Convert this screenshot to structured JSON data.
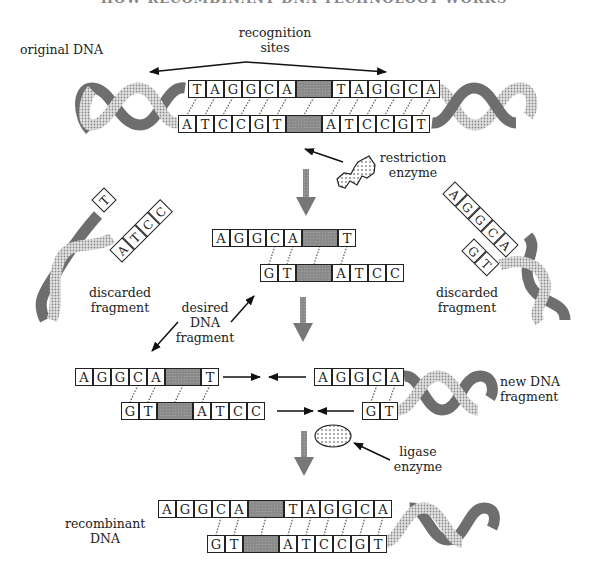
{
  "title": "HOW RECOMBINANT DNA TECHNOLOGY WORKS",
  "colors": {
    "box_border": "#222222",
    "box_fill": "#ffffff",
    "cut_site_fill": "#8a8a8a",
    "helix_dark": "#6e6e6e",
    "helix_light": "#b8b8b8",
    "arrow": "#111111",
    "process_arrow": "#7a7a7a"
  },
  "labels": {
    "recognition_sites": [
      "recognition",
      "sites"
    ],
    "original_dna": "original DNA",
    "restriction_enzyme": [
      "restriction",
      "enzyme"
    ],
    "discarded_fragment_left": [
      "discarded",
      "fragment"
    ],
    "discarded_fragment_right": [
      "discarded",
      "fragment"
    ],
    "desired_dna_fragment": [
      "desired",
      "DNA",
      "fragment"
    ],
    "new_dna_fragment": [
      "new DNA",
      "fragment"
    ],
    "ligase_enzyme": [
      "ligase",
      "enzyme"
    ],
    "recombinant_dna": [
      "recombinant",
      "DNA"
    ]
  },
  "strands": {
    "original_top": [
      "T",
      "A",
      "G",
      "G",
      "C",
      "A",
      "",
      "T",
      "A",
      "G",
      "G",
      "C",
      "A"
    ],
    "original_bottom": [
      "A",
      "T",
      "C",
      "C",
      "G",
      "T",
      "",
      "A",
      "T",
      "C",
      "C",
      "G",
      "T"
    ],
    "discarded_left_top": [
      "T"
    ],
    "discarded_left_bottom": [
      "A",
      "T",
      "C",
      "C"
    ],
    "cut_fragment_top": [
      "A",
      "G",
      "G",
      "C",
      "A",
      "",
      "T"
    ],
    "cut_fragment_bottom": [
      "G",
      "T",
      "",
      "A",
      "T",
      "C",
      "C"
    ],
    "discarded_right_top": [
      "A",
      "G",
      "G",
      "C",
      "A"
    ],
    "discarded_right_bottom": [
      "G",
      "T"
    ],
    "joining_left_top": [
      "A",
      "G",
      "G",
      "C",
      "A",
      "",
      "T"
    ],
    "joining_left_bottom": [
      "G",
      "T",
      "",
      "A",
      "T",
      "C",
      "C"
    ],
    "new_fragment_top": [
      "A",
      "G",
      "G",
      "C",
      "A"
    ],
    "new_fragment_bottom": [
      "G",
      "T"
    ],
    "recombinant_top": [
      "A",
      "G",
      "G",
      "C",
      "A",
      "",
      "T",
      "A",
      "G",
      "G",
      "C",
      "A"
    ],
    "recombinant_bottom": [
      "G",
      "T",
      "",
      "A",
      "T",
      "C",
      "C",
      "G",
      "T"
    ]
  }
}
